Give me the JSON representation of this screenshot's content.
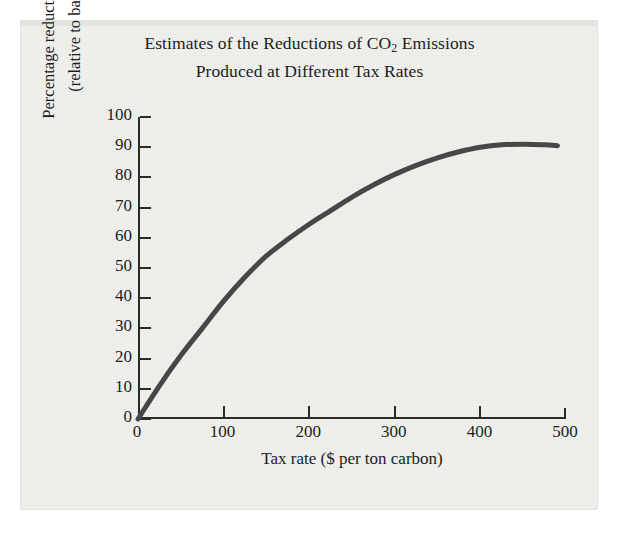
{
  "chart_data": {
    "type": "line",
    "title_lines": [
      "Estimates of the Reductions of CO₂ Emissions",
      "Produced at Different Tax Rates"
    ],
    "title": "Estimates of the Reductions of CO2 Emissions Produced at Different Tax Rates",
    "xlabel": "Tax rate ($ per ton carbon)",
    "ylabel_lines": [
      "Percentage reduction of CO₂",
      "(relative to baseline)"
    ],
    "ylabel": "Percentage reduction of CO2 (relative to baseline)",
    "xlim": [
      0,
      500
    ],
    "ylim": [
      0,
      100
    ],
    "xticks": [
      0,
      100,
      200,
      300,
      400,
      500
    ],
    "xtick_labels": [
      "0",
      "100",
      "200",
      "300",
      "400",
      "500"
    ],
    "yticks": [
      0,
      10,
      20,
      30,
      40,
      50,
      60,
      70,
      80,
      90,
      100
    ],
    "ytick_labels": [
      "0",
      "10",
      "20",
      "30",
      "40",
      "50",
      "60",
      "70",
      "80",
      "90",
      "100"
    ],
    "grid": false,
    "legend": null,
    "series": [
      {
        "name": "CO2 reduction vs tax rate",
        "color": "#474747",
        "line_width": 5,
        "x": [
          0,
          25,
          50,
          75,
          100,
          125,
          150,
          175,
          200,
          225,
          250,
          275,
          300,
          325,
          350,
          375,
          400,
          425,
          450,
          475,
          490
        ],
        "values": [
          0,
          11,
          21,
          30,
          39,
          47,
          54,
          59.5,
          64.5,
          69,
          73.5,
          77.5,
          81,
          84,
          86.5,
          88.5,
          90,
          90.8,
          91,
          90.8,
          90.5
        ]
      }
    ]
  },
  "colors": {
    "curve": "#474747",
    "axis": "#2a2a2a",
    "text": "#1c1c1c",
    "panel_background": "#efefec",
    "page_background": "#ffffff"
  }
}
